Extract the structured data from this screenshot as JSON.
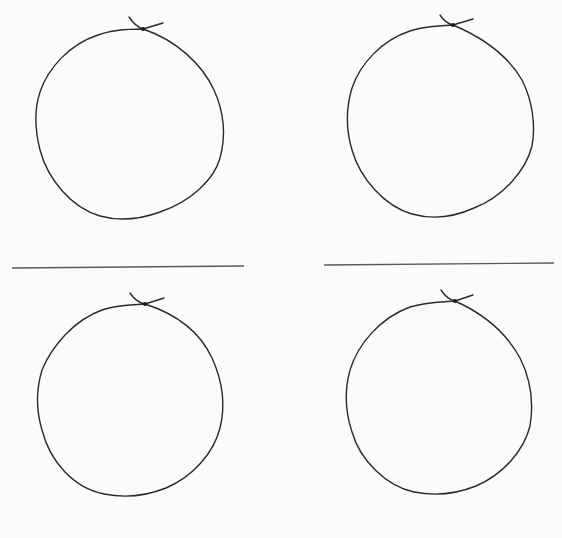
{
  "page": {
    "background": "#fbfbfa",
    "ink_color": "#2a2a2a"
  },
  "figures": [
    {
      "id": "circle-top-left",
      "quadrant": "top-left",
      "shape": "hand-drawn circle with knot at top"
    },
    {
      "id": "circle-top-right",
      "quadrant": "top-right",
      "shape": "hand-drawn circle with knot at top"
    },
    {
      "id": "circle-bottom-left",
      "quadrant": "bottom-left",
      "shape": "hand-drawn circle with knot at top"
    },
    {
      "id": "circle-bottom-right",
      "quadrant": "bottom-right",
      "shape": "hand-drawn circle with knot at top"
    }
  ],
  "dividers": [
    {
      "id": "divider-left",
      "side": "left"
    },
    {
      "id": "divider-right",
      "side": "right"
    }
  ]
}
